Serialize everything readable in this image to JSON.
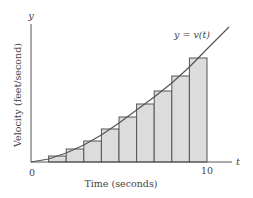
{
  "chart_data": {
    "type": "bar",
    "title": "",
    "xlabel": "Time (seconds)",
    "ylabel": "Velocity (feet/second)",
    "x_axis_symbol": "t",
    "y_axis_symbol": "y",
    "curve_label": "y = v(t)",
    "x_ticks": [
      {
        "value": 0,
        "label": "0"
      },
      {
        "value": 10,
        "label": "10"
      }
    ],
    "xlim": [
      0,
      11.5
    ],
    "grid": false,
    "legend": "none",
    "bar_width_seconds": 1,
    "categories": [
      "0-1",
      "1-2",
      "2-3",
      "3-4",
      "4-5",
      "5-6",
      "6-7",
      "7-8",
      "8-9",
      "9-10"
    ],
    "values": [
      0,
      6,
      13,
      21,
      33,
      45,
      58,
      71,
      86,
      104
    ],
    "values_units": "relative (pixel-scale, no y tick labels shown)",
    "curve": {
      "name": "v(t)",
      "t": [
        0,
        1,
        2,
        3,
        4,
        5,
        6,
        7,
        8,
        9,
        10,
        11.25
      ],
      "v": [
        0,
        3,
        9,
        17,
        27,
        39,
        52,
        65,
        79,
        95,
        113,
        135
      ]
    },
    "colors": {
      "bar_fill": "#dcdcdc",
      "bar_stroke": "#555555",
      "curve": "#555555",
      "axis": "#555555",
      "text": "#444444"
    }
  }
}
